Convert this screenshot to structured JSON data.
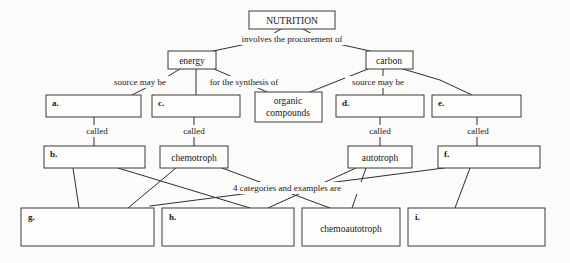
{
  "diagram": {
    "title": "NUTRITION",
    "type": "concept-map",
    "background_color": "#fbfbf9",
    "line_color": "#2e2e2e",
    "box_fill": "#fdfdfb"
  },
  "nodes": {
    "nutrition": {
      "label": "NUTRITION",
      "x": 249,
      "y": 11,
      "w": 86,
      "h": 18
    },
    "energy": {
      "label": "energy",
      "x": 168,
      "y": 51,
      "w": 48,
      "h": 18
    },
    "carbon": {
      "label": "carbon",
      "x": 366,
      "y": 51,
      "w": 47,
      "h": 18
    },
    "a": {
      "label": "a.",
      "x": 46,
      "y": 95,
      "w": 95,
      "h": 22
    },
    "c": {
      "label": "c.",
      "x": 152,
      "y": 95,
      "w": 88,
      "h": 22
    },
    "organic_compounds_line1": {
      "label": "organic",
      "x": 255,
      "y": 92,
      "w": 67,
      "h": 30
    },
    "organic_compounds_line2": {
      "label": "compounds"
    },
    "d": {
      "label": "d.",
      "x": 336,
      "y": 95,
      "w": 88,
      "h": 22
    },
    "e": {
      "label": "e.",
      "x": 432,
      "y": 95,
      "w": 89,
      "h": 22
    },
    "b": {
      "label": "b.",
      "x": 44,
      "y": 146,
      "w": 101,
      "h": 22
    },
    "chemotroph": {
      "label": "chemotroph",
      "x": 160,
      "y": 146,
      "w": 68,
      "h": 22
    },
    "autotroph": {
      "label": "autotroph",
      "x": 348,
      "y": 146,
      "w": 64,
      "h": 22
    },
    "f": {
      "label": "f.",
      "x": 438,
      "y": 146,
      "w": 102,
      "h": 22
    },
    "g": {
      "label": "g.",
      "x": 21,
      "y": 208,
      "w": 133,
      "h": 38
    },
    "h": {
      "label": "h.",
      "x": 162,
      "y": 208,
      "w": 132,
      "h": 38
    },
    "chemoautotroph": {
      "label": "chemoautotroph",
      "x": 302,
      "y": 208,
      "w": 98,
      "h": 38
    },
    "i": {
      "label": "i.",
      "x": 408,
      "y": 208,
      "w": 137,
      "h": 38
    }
  },
  "edge_labels": [
    {
      "text": "involves the procurement of",
      "x": 292,
      "y": 41
    },
    {
      "text": "source may be",
      "x": 140,
      "y": 84
    },
    {
      "text": "for the synthesis of",
      "x": 244,
      "y": 84
    },
    {
      "text": "source may be",
      "x": 378,
      "y": 84
    },
    {
      "text": "called",
      "x": 97,
      "y": 133
    },
    {
      "text": "called",
      "x": 194,
      "y": 133
    },
    {
      "text": "called",
      "x": 380,
      "y": 133
    },
    {
      "text": "called",
      "x": 478,
      "y": 133
    },
    {
      "text": "4 categories and examples are",
      "x": 287,
      "y": 190
    }
  ],
  "connectors": [
    {
      "from": "nutrition",
      "to": "energy",
      "points": "281,29 261,41 213,51"
    },
    {
      "from": "nutrition",
      "to": "carbon",
      "points": "303,29 325,41 370,51"
    },
    {
      "from": "energy",
      "to": "a",
      "points": "180,69 165,78 132,95"
    },
    {
      "from": "energy",
      "to": "c",
      "points": "196,69 196,84 196,95"
    },
    {
      "from": "energy",
      "to": "organic-compounds",
      "points": "214,69 240,80 267,92"
    },
    {
      "from": "carbon",
      "to": "organic-compounds",
      "points": "368,69 340,80 310,92"
    },
    {
      "from": "carbon",
      "to": "d",
      "points": "383,69 383,84 383,95"
    },
    {
      "from": "carbon",
      "to": "e",
      "points": "403,69 440,80 472,95"
    },
    {
      "from": "a",
      "to": "b",
      "points": "94,117 94,146"
    },
    {
      "from": "c",
      "to": "chemotroph",
      "points": "194,117 194,146"
    },
    {
      "from": "d",
      "to": "autotroph",
      "points": "380,117 380,146"
    },
    {
      "from": "e",
      "to": "f",
      "points": "477,117 477,146"
    },
    {
      "from": "b",
      "to": "g",
      "points": "73,168 79,208"
    },
    {
      "from": "b",
      "to": "h",
      "points": "118,168 250,208"
    },
    {
      "from": "chemotroph",
      "to": "g",
      "points": "176,168 128,208"
    },
    {
      "from": "chemotroph",
      "to": "chemoautotroph",
      "points": "222,168 330,208"
    },
    {
      "from": "autotroph",
      "to": "h",
      "points": "356,168 268,208"
    },
    {
      "from": "autotroph",
      "to": "chemoautotroph",
      "points": "366,168 352,208"
    },
    {
      "from": "f",
      "to": "g",
      "points": "444,168 150,206"
    },
    {
      "from": "f",
      "to": "i",
      "points": "470,168 455,208"
    }
  ]
}
